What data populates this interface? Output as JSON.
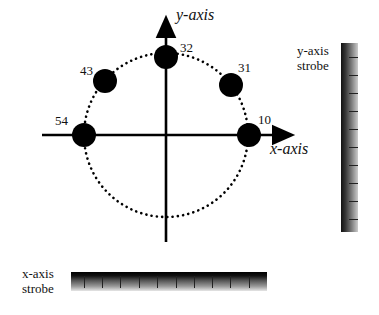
{
  "diagram": {
    "axes": {
      "x_label": "x-axis",
      "y_label": "y-axis"
    },
    "points": [
      {
        "label": "32",
        "angle_deg": 90
      },
      {
        "label": "43",
        "angle_deg": 135
      },
      {
        "label": "31",
        "angle_deg": 45
      },
      {
        "label": "54",
        "angle_deg": 180
      },
      {
        "label": "10",
        "angle_deg": 0
      }
    ],
    "strobes": {
      "y": {
        "label_line1": "y-axis",
        "label_line2": "strobe",
        "tick_count": 10
      },
      "x": {
        "label_line1": "x-axis",
        "label_line2": "strobe",
        "tick_count": 10
      }
    },
    "colors": {
      "ink": "#000000",
      "background": "#ffffff"
    }
  }
}
